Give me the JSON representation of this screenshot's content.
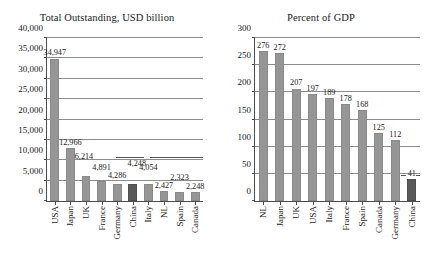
{
  "chart_data": [
    {
      "type": "bar",
      "title": "Total Outstanding, USD billion",
      "xlabel": "",
      "ylabel": "",
      "ylim": [
        0,
        40000
      ],
      "ytick_step": 5000,
      "grid": true,
      "legend": "none",
      "yticks": [
        "0",
        "5,000",
        "10,000",
        "15,000",
        "20,000",
        "25,000",
        "30,000",
        "35,000",
        "40,000"
      ],
      "categories": [
        "USA",
        "Japan",
        "UK",
        "France",
        "Germany",
        "China",
        "Italy",
        "NL",
        "Spain",
        "Canada"
      ],
      "values": [
        34947,
        12966,
        6214,
        4891,
        4286,
        4248,
        4054,
        2427,
        2323,
        2248
      ],
      "data_labels": [
        "34,947",
        "12,966",
        "6,214",
        "4,891",
        "4,286",
        "4,248",
        "4,054",
        "2,427",
        "2,323",
        "2,248"
      ],
      "highlight_category": "China",
      "bar_color": "#969696",
      "highlight_color": "#595959"
    },
    {
      "type": "bar",
      "title": "Percent of GDP",
      "xlabel": "",
      "ylabel": "",
      "ylim": [
        0,
        300
      ],
      "ytick_step": 50,
      "grid": true,
      "legend": "none",
      "yticks": [
        "0",
        "50",
        "100",
        "150",
        "200",
        "250",
        "300"
      ],
      "categories": [
        "NL",
        "Japan",
        "UK",
        "USA",
        "Italy",
        "France",
        "Spain",
        "Canada",
        "Germany",
        "China"
      ],
      "values": [
        276,
        272,
        207,
        197,
        189,
        178,
        168,
        125,
        112,
        41
      ],
      "data_labels": [
        "276",
        "272",
        "207",
        "197",
        "189",
        "178",
        "168",
        "125",
        "112",
        "41"
      ],
      "highlight_category": "China",
      "bar_color": "#969696",
      "highlight_color": "#595959"
    }
  ]
}
